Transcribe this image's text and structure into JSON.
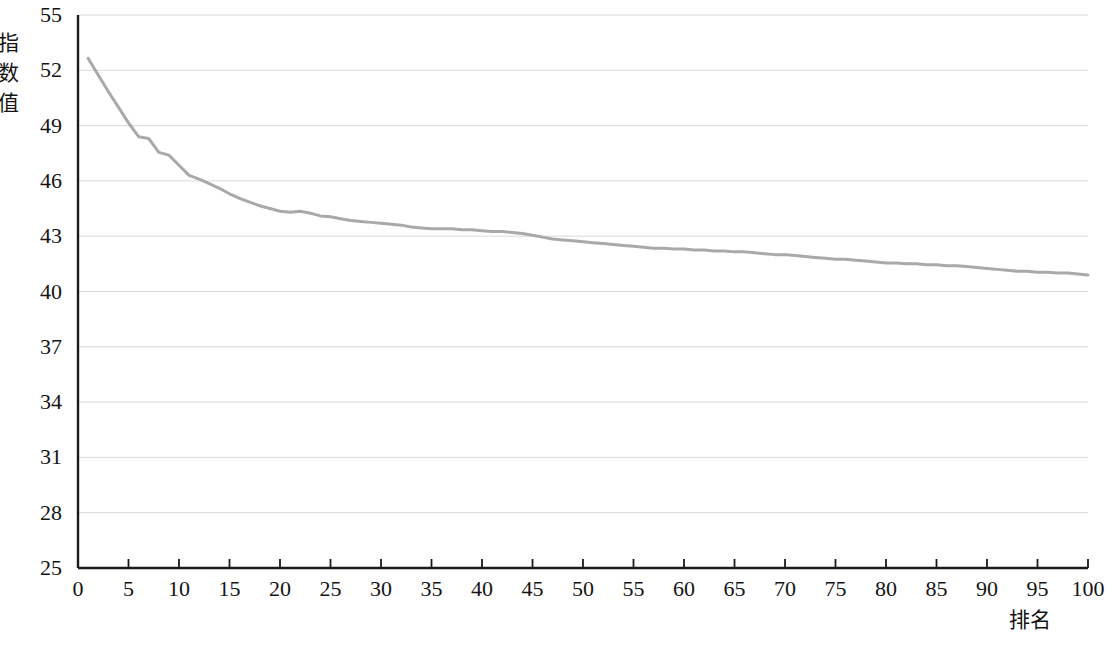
{
  "chart_data": {
    "type": "line",
    "title": "",
    "subtitle": "",
    "xlabel": "排名",
    "ylabel": "指数值",
    "xlim": [
      0,
      100
    ],
    "ylim": [
      25,
      55
    ],
    "grid": true,
    "grid_axis": "y",
    "legend": null,
    "legend_position": "none",
    "line_color": "#a9a9a9",
    "line_width": 3,
    "axis_color": "#1a1a1a",
    "gridline_color": "#d9d9d9",
    "x_ticks": [
      0,
      5,
      10,
      15,
      20,
      25,
      30,
      35,
      40,
      45,
      50,
      55,
      60,
      65,
      70,
      75,
      80,
      85,
      90,
      95,
      100
    ],
    "y_ticks": [
      25,
      28,
      31,
      34,
      37,
      40,
      43,
      46,
      49,
      52,
      55
    ],
    "x_tick_labels": [
      "0",
      "5",
      "10",
      "15",
      "20",
      "25",
      "30",
      "35",
      "40",
      "45",
      "50",
      "55",
      "60",
      "65",
      "70",
      "75",
      "80",
      "85",
      "90",
      "95",
      "100"
    ],
    "y_tick_labels": [
      "25",
      "28",
      "31",
      "34",
      "37",
      "40",
      "43",
      "46",
      "49",
      "52",
      "55"
    ],
    "series": [
      {
        "name": "指数值",
        "x": [
          1,
          2,
          3,
          4,
          5,
          6,
          7,
          8,
          9,
          10,
          11,
          12,
          13,
          14,
          15,
          16,
          17,
          18,
          19,
          20,
          21,
          22,
          23,
          24,
          25,
          26,
          27,
          28,
          29,
          30,
          31,
          32,
          33,
          34,
          35,
          36,
          37,
          38,
          39,
          40,
          41,
          42,
          43,
          44,
          45,
          46,
          47,
          48,
          49,
          50,
          51,
          52,
          53,
          54,
          55,
          56,
          57,
          58,
          59,
          60,
          61,
          62,
          63,
          64,
          65,
          66,
          67,
          68,
          69,
          70,
          71,
          72,
          73,
          74,
          75,
          76,
          77,
          78,
          79,
          80,
          81,
          82,
          83,
          84,
          85,
          86,
          87,
          88,
          89,
          90,
          91,
          92,
          93,
          94,
          95,
          96,
          97,
          98,
          99,
          100
        ],
        "values": [
          52.65,
          51.75,
          50.85,
          50.0,
          49.15,
          48.4,
          48.3,
          47.55,
          47.4,
          46.85,
          46.3,
          46.1,
          45.85,
          45.6,
          45.3,
          45.05,
          44.85,
          44.65,
          44.5,
          44.35,
          44.3,
          44.35,
          44.25,
          44.1,
          44.05,
          43.95,
          43.85,
          43.8,
          43.75,
          43.7,
          43.65,
          43.6,
          43.5,
          43.45,
          43.4,
          43.4,
          43.4,
          43.35,
          43.35,
          43.3,
          43.25,
          43.25,
          43.2,
          43.15,
          43.05,
          42.95,
          42.85,
          42.8,
          42.75,
          42.7,
          42.65,
          42.6,
          42.55,
          42.5,
          42.45,
          42.4,
          42.35,
          42.35,
          42.3,
          42.3,
          42.25,
          42.25,
          42.2,
          42.2,
          42.15,
          42.15,
          42.1,
          42.05,
          42.0,
          42.0,
          41.95,
          41.9,
          41.85,
          41.8,
          41.75,
          41.75,
          41.7,
          41.65,
          41.6,
          41.55,
          41.55,
          41.5,
          41.5,
          41.45,
          41.45,
          41.4,
          41.4,
          41.35,
          41.3,
          41.25,
          41.2,
          41.15,
          41.1,
          41.1,
          41.05,
          41.05,
          41.0,
          41.0,
          40.95,
          40.9
        ]
      }
    ],
    "first_point": {
      "x": 1,
      "y": 52.65
    },
    "last_point": {
      "x": 100,
      "y": 40.9
    },
    "max_value": 52.65,
    "min_value": 40.9
  },
  "axes": {
    "y_title": "指数值",
    "x_title": "排名"
  }
}
